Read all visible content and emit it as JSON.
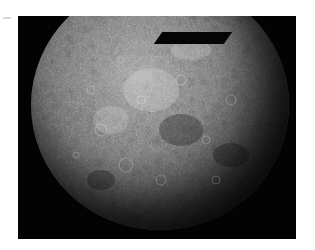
{
  "image": {
    "subject": "Planet Mercury mosaic photograph",
    "description": "Grayscale cratered planetary disk on black background, top portion clipped by frame",
    "colors": {
      "page_background": "#ffffff",
      "frame_background": "#030303",
      "surface_light": "#a9a9a9",
      "surface_mid": "#6e6e6e",
      "surface_dark": "#262626"
    }
  }
}
